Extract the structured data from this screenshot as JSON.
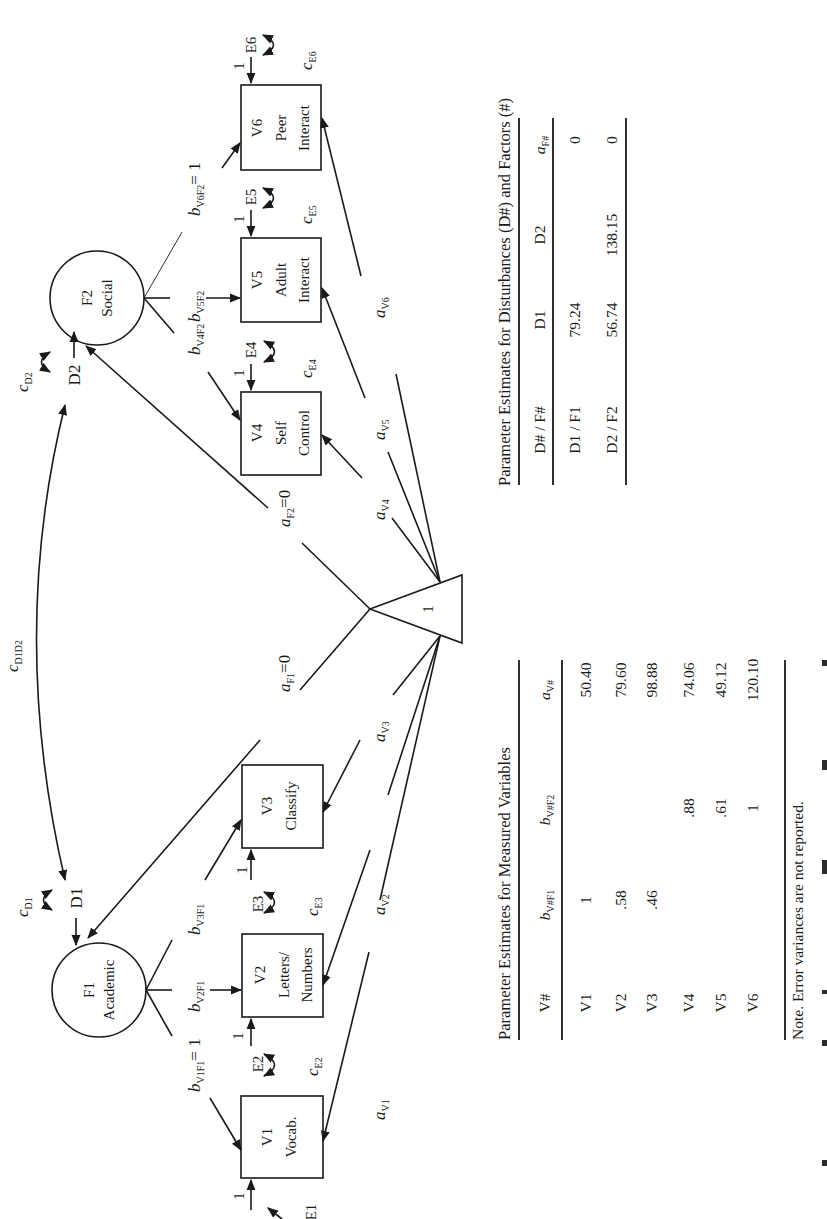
{
  "figure": {
    "orientation": "rotated-90-ccw",
    "factors": [
      {
        "id": "F1",
        "name": "Academic"
      },
      {
        "id": "F2",
        "name": "Social"
      }
    ],
    "disturbances": [
      "D1",
      "D2"
    ],
    "measured": [
      {
        "id": "V1",
        "line1": "Vocab.",
        "line2": ""
      },
      {
        "id": "V2",
        "line1": "Letters/",
        "line2": "Numbers"
      },
      {
        "id": "V3",
        "line1": "Classify",
        "line2": ""
      },
      {
        "id": "V4",
        "line1": "Self",
        "line2": "Control"
      },
      {
        "id": "V5",
        "line1": "Adult",
        "line2": "Interact"
      },
      {
        "id": "V6",
        "line1": "Peer",
        "line2": "Interact"
      }
    ],
    "errors": [
      "E1",
      "E2",
      "E3",
      "E4",
      "E5",
      "E6"
    ],
    "error_path_label": "1",
    "constant_label": "1",
    "path_labels": {
      "b": "b",
      "a": "a",
      "c": "c",
      "b_V1F1_sub": "V1F1",
      "b_V1F1_eq": "= 1",
      "b_V2F1_sub": "V2F1",
      "b_V3F1_sub": "V3F1",
      "b_V4F2_sub": "V4F2",
      "b_V5F2_sub": "V5F2",
      "b_V6F2_sub": "V6F2",
      "b_V6F2_eq": "= 1",
      "a_F1_sub": "F1",
      "a_F1_eq": "=0",
      "a_F2_sub": "F2",
      "a_F2_eq": "=0",
      "a_V1_sub": "V1",
      "a_V2_sub": "V2",
      "a_V3_sub": "V3",
      "a_V4_sub": "V4",
      "a_V5_sub": "V5",
      "a_V6_sub": "V6",
      "c_D1_sub": "D1",
      "c_D2_sub": "D2",
      "c_D1D2_sub": "D1D2",
      "c_E1_sub": "E1",
      "c_E2_sub": "E2",
      "c_E3_sub": "E3",
      "c_E4_sub": "E4",
      "c_E5_sub": "E5",
      "c_E6_sub": "E6"
    }
  },
  "table_disturbances": {
    "title": "Parameter Estimates for Disturbances (D#) and Factors (#)",
    "headers": [
      "D# / F#",
      "D1",
      "D2",
      "a",
      "F#"
    ],
    "rows": [
      {
        "label": "D1 / F1",
        "D1": "79.24",
        "D2": "",
        "aF": "0"
      },
      {
        "label": "D2 / F2",
        "D1": "56.74",
        "D2": "138.15",
        "aF": "0"
      }
    ]
  },
  "table_measured": {
    "title": "Parameter Estimates for Measured Variables",
    "headers": {
      "v": "V#",
      "b1": "b",
      "b1_sub": "V#F1",
      "b2": "b",
      "b2_sub": "V#F2",
      "a": "a",
      "a_sub": "V#"
    },
    "rows": [
      {
        "v": "V1",
        "b1": "1",
        "b2": "",
        "a": "50.40"
      },
      {
        "v": "V2",
        "b1": ".58",
        "b2": "",
        "a": "79.60"
      },
      {
        "v": "V3",
        "b1": ".46",
        "b2": "",
        "a": "98.88"
      },
      {
        "v": "V4",
        "b1": "",
        "b2": ".88",
        "a": "74.06"
      },
      {
        "v": "V5",
        "b1": "",
        "b2": ".61",
        "a": "49.12"
      },
      {
        "v": "V6",
        "b1": "",
        "b2": "1",
        "a": "120.10"
      }
    ],
    "note": "Note. Error variances are not reported."
  }
}
